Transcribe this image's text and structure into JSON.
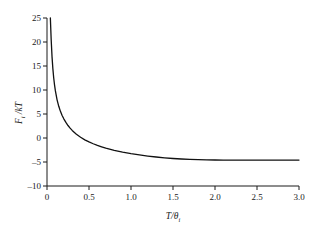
{
  "chart_data": {
    "type": "line",
    "title": "",
    "xlabel": "T/θi",
    "xlabel_main": "T/θ",
    "xlabel_sub": "i",
    "ylabel": "Fi /kT",
    "ylabel_main": "F",
    "ylabel_sub": "i",
    "ylabel_rest": " /kT",
    "xlim": [
      0.0,
      3.0
    ],
    "ylim": [
      -10,
      25
    ],
    "xticks": [
      0,
      0.5,
      1.0,
      1.5,
      2.0,
      2.5,
      3.0
    ],
    "xtick_labels": [
      "0",
      "0.5",
      "1.0",
      "1.5",
      "2.0",
      "2.5",
      "3.0"
    ],
    "yticks": [
      -10,
      -5,
      0,
      5,
      10,
      15,
      20,
      25
    ],
    "ytick_labels": [
      "-10",
      "-5",
      "0",
      "5",
      "10",
      "15",
      "20",
      "25"
    ],
    "grid": false,
    "legend": "none",
    "curve_color": "#111111",
    "axis_color": "#1a1a1a",
    "background": "#ffffff",
    "series": [
      {
        "name": "Fi/kT",
        "x": [
          0.04,
          0.045,
          0.05,
          0.055,
          0.06,
          0.065,
          0.07,
          0.075,
          0.08,
          0.085,
          0.09,
          0.095,
          0.1,
          0.11,
          0.12,
          0.13,
          0.14,
          0.15,
          0.16,
          0.17,
          0.18,
          0.19,
          0.2,
          0.22,
          0.24,
          0.26,
          0.28,
          0.3,
          0.325,
          0.35,
          0.375,
          0.4,
          0.425,
          0.45,
          0.475,
          0.5,
          0.55,
          0.6,
          0.65,
          0.7,
          0.75,
          0.8,
          0.85,
          0.9,
          0.95,
          1.0,
          1.1,
          1.2,
          1.3,
          1.4,
          1.5,
          1.6,
          1.7,
          1.8,
          1.9,
          2.0,
          2.1,
          2.2,
          2.3,
          2.4,
          2.5,
          2.6,
          2.7,
          2.8,
          2.9,
          3.0
        ],
        "y": [
          25.0,
          22.6,
          20.7,
          19.1,
          17.8,
          16.6,
          15.6,
          14.7,
          13.9,
          13.2,
          12.55,
          11.95,
          11.4,
          10.45,
          9.62,
          8.9,
          8.26,
          7.68,
          7.16,
          6.68,
          6.23,
          5.82,
          5.43,
          4.73,
          4.1,
          3.53,
          3.01,
          2.52,
          1.96,
          1.44,
          0.95,
          0.49,
          0.05,
          -0.37,
          -0.78,
          -1.17,
          -1.9,
          -2.58,
          -3.21,
          -3.81,
          -4.38,
          -4.92,
          -5.43,
          -5.92,
          -6.39,
          -6.84,
          -7.69,
          -8.49,
          -9.23,
          -9.93,
          -10.59,
          -11.21,
          -11.81,
          -12.37,
          -12.91,
          -13.43,
          -13.93,
          -14.41,
          -14.87,
          -15.31,
          -15.74,
          -16.16,
          -16.56,
          -16.95,
          -17.33,
          -17.7
        ],
        "y_display": [
          25.0,
          22.6,
          20.7,
          19.1,
          17.8,
          16.6,
          15.6,
          14.7,
          13.9,
          13.2,
          12.55,
          11.95,
          11.4,
          10.45,
          9.62,
          8.9,
          8.26,
          7.68,
          7.16,
          6.68,
          6.23,
          5.82,
          5.43,
          4.73,
          4.1,
          3.53,
          3.01,
          2.52,
          1.96,
          1.44,
          0.95,
          0.49,
          0.05,
          -0.37,
          -0.78,
          -1.17,
          -1.9,
          -2.58,
          -3.21,
          -3.81,
          -4.38,
          -4.92,
          -5.43,
          -5.92,
          -6.39,
          -6.84,
          -7.69,
          -8.49,
          -9.23,
          -9.93,
          -10.59,
          -11.21,
          -11.81,
          -12.37,
          -12.91,
          -13.43,
          -13.93,
          -14.41,
          -14.87,
          -15.31,
          -15.74,
          -16.16,
          -16.56,
          -16.95,
          -17.33,
          -17.7
        ]
      }
    ],
    "notes": {
      "shape": "monotonically decreasing, steep divergence toward +25 as x approaches 0, zero crossing near x = 0.62, shallow tail approaching about -4.6 at x = 3.0",
      "zero_crossing_x": 0.62,
      "value_at_x_3": -4.6
    },
    "plot_points_visual": {
      "x": [
        0.04,
        0.05,
        0.06,
        0.07,
        0.08,
        0.09,
        0.1,
        0.12,
        0.14,
        0.16,
        0.18,
        0.2,
        0.225,
        0.25,
        0.275,
        0.3,
        0.35,
        0.4,
        0.45,
        0.5,
        0.55,
        0.6,
        0.65,
        0.7,
        0.8,
        0.9,
        1.0,
        1.1,
        1.2,
        1.3,
        1.4,
        1.5,
        1.6,
        1.7,
        1.8,
        1.9,
        2.0,
        2.1,
        2.2,
        2.3,
        2.4,
        2.5,
        2.6,
        2.7,
        2.8,
        2.9,
        3.0
      ],
      "y": [
        25.0,
        20.4,
        16.9,
        14.4,
        12.5,
        11.0,
        9.8,
        7.95,
        6.6,
        5.55,
        4.7,
        4.0,
        3.25,
        2.6,
        2.05,
        1.58,
        0.78,
        0.15,
        -0.38,
        -0.82,
        -1.2,
        -1.54,
        -1.83,
        -2.1,
        -2.56,
        -2.94,
        -3.26,
        -3.53,
        -3.76,
        -3.96,
        -4.13,
        -4.27,
        -4.38,
        -4.46,
        -4.52,
        -4.56,
        -4.58,
        -4.59,
        -4.6,
        -4.6,
        -4.6,
        -4.6,
        -4.6,
        -4.6,
        -4.6,
        -4.6,
        -4.6
      ]
    }
  }
}
